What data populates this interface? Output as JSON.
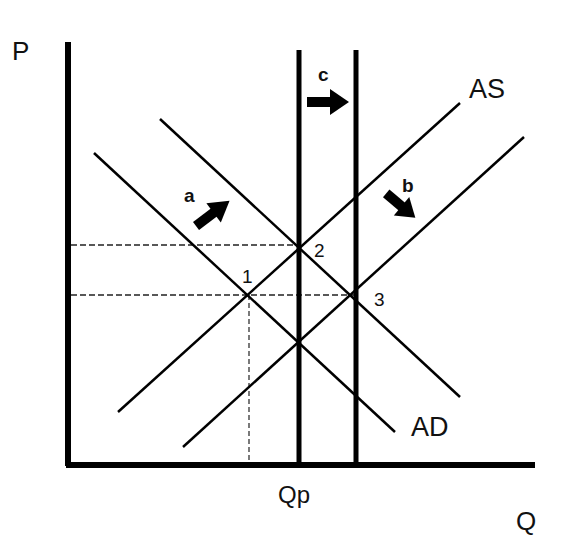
{
  "diagram": {
    "type": "economics AD-AS diagram",
    "axes": {
      "y_label": "P",
      "x_label": "Q",
      "x_marker": "Qp"
    },
    "curves": {
      "as_label": "AS",
      "ad_label": "AD",
      "as_curves": [
        "AS (original)",
        "AS (shifted right)"
      ],
      "ad_curves": [
        "AD (original)",
        "AD (shifted right)"
      ],
      "vertical_lines": [
        "Qp (potential output)",
        "Qp (shifted right)"
      ]
    },
    "arrows": {
      "a": "a",
      "b": "b",
      "c": "c"
    },
    "points": {
      "p1": "1",
      "p2": "2",
      "p3": "3"
    }
  }
}
